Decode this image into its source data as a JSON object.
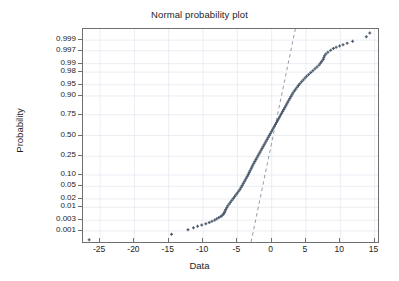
{
  "chart_data": {
    "type": "scatter",
    "title": "Normal probability plot",
    "xlabel": "Data",
    "ylabel": "Probability",
    "grid": true,
    "legend": "none",
    "xlim": [
      -27.5,
      15.5
    ],
    "xticks": [
      -25,
      -20,
      -15,
      -10,
      -5,
      0,
      5,
      10,
      15
    ],
    "xtick_labels": [
      "-25",
      "-20",
      "-15",
      "-10",
      "-5",
      "0",
      "5",
      "10",
      "15"
    ],
    "prob_ticks": [
      0.001,
      0.003,
      0.01,
      0.02,
      0.05,
      0.1,
      0.25,
      0.5,
      0.75,
      0.9,
      0.95,
      0.98,
      0.99,
      0.997,
      0.999
    ],
    "prob_tick_labels": [
      "0.001",
      "0.003",
      "0.01",
      "0.02",
      "0.05",
      "0.10",
      "0.25",
      "0.50",
      "0.75",
      "0.90",
      "0.95",
      "0.98",
      "0.99",
      "0.997",
      "0.999"
    ],
    "zlim": [
      -3.45,
      3.45
    ],
    "series": [
      {
        "name": "sample data",
        "marker": "+",
        "color": "#4a5a6a",
        "points": [
          [
            -26.6,
            -3.38
          ],
          [
            -14.6,
            -3.2
          ],
          [
            -12.2,
            -3.05
          ],
          [
            -11.4,
            -2.99
          ],
          [
            -10.8,
            -2.94
          ],
          [
            -10.2,
            -2.9
          ],
          [
            -9.6,
            -2.86
          ],
          [
            -9.1,
            -2.82
          ],
          [
            -8.7,
            -2.78
          ],
          [
            -8.3,
            -2.74
          ],
          [
            -8.0,
            -2.7
          ],
          [
            -7.7,
            -2.66
          ],
          [
            -7.4,
            -2.62
          ],
          [
            -7.2,
            -2.58
          ],
          [
            -7.0,
            -2.54
          ],
          [
            -6.9,
            -2.5
          ],
          [
            -6.8,
            -2.45
          ],
          [
            -6.7,
            -2.4
          ],
          [
            -6.55,
            -2.34
          ],
          [
            -6.4,
            -2.28
          ],
          [
            -6.2,
            -2.22
          ],
          [
            -6.0,
            -2.16
          ],
          [
            -5.8,
            -2.1
          ],
          [
            -5.6,
            -2.04
          ],
          [
            -5.4,
            -1.98
          ],
          [
            -5.2,
            -1.92
          ],
          [
            -5.0,
            -1.86
          ],
          [
            -4.8,
            -1.8
          ],
          [
            -4.6,
            -1.74
          ],
          [
            -4.45,
            -1.68
          ],
          [
            -4.3,
            -1.62
          ],
          [
            -4.15,
            -1.56
          ],
          [
            -4.0,
            -1.5
          ],
          [
            -3.85,
            -1.44
          ],
          [
            -3.7,
            -1.38
          ],
          [
            -3.55,
            -1.32
          ],
          [
            -3.4,
            -1.26
          ],
          [
            -3.28,
            -1.2
          ],
          [
            -3.15,
            -1.14
          ],
          [
            -3.0,
            -1.08
          ],
          [
            -2.88,
            -1.02
          ],
          [
            -2.75,
            -0.96
          ],
          [
            -2.6,
            -0.9
          ],
          [
            -2.45,
            -0.84
          ],
          [
            -2.3,
            -0.78
          ],
          [
            -2.15,
            -0.72
          ],
          [
            -2.0,
            -0.66
          ],
          [
            -1.85,
            -0.6
          ],
          [
            -1.7,
            -0.54
          ],
          [
            -1.55,
            -0.48
          ],
          [
            -1.4,
            -0.42
          ],
          [
            -1.25,
            -0.36
          ],
          [
            -1.1,
            -0.3
          ],
          [
            -0.95,
            -0.24
          ],
          [
            -0.8,
            -0.18
          ],
          [
            -0.65,
            -0.12
          ],
          [
            -0.5,
            -0.06
          ],
          [
            -0.35,
            0.0
          ],
          [
            -0.2,
            0.06
          ],
          [
            -0.05,
            0.12
          ],
          [
            0.1,
            0.18
          ],
          [
            0.25,
            0.24
          ],
          [
            0.4,
            0.3
          ],
          [
            0.55,
            0.36
          ],
          [
            0.7,
            0.42
          ],
          [
            0.85,
            0.48
          ],
          [
            1.0,
            0.54
          ],
          [
            1.15,
            0.6
          ],
          [
            1.3,
            0.66
          ],
          [
            1.45,
            0.72
          ],
          [
            1.6,
            0.78
          ],
          [
            1.75,
            0.84
          ],
          [
            1.9,
            0.9
          ],
          [
            2.05,
            0.96
          ],
          [
            2.2,
            1.02
          ],
          [
            2.35,
            1.08
          ],
          [
            2.5,
            1.14
          ],
          [
            2.65,
            1.2
          ],
          [
            2.8,
            1.26
          ],
          [
            2.95,
            1.32
          ],
          [
            3.1,
            1.38
          ],
          [
            3.3,
            1.44
          ],
          [
            3.5,
            1.5
          ],
          [
            3.7,
            1.56
          ],
          [
            3.9,
            1.62
          ],
          [
            4.1,
            1.68
          ],
          [
            4.35,
            1.74
          ],
          [
            4.6,
            1.8
          ],
          [
            4.85,
            1.86
          ],
          [
            5.1,
            1.92
          ],
          [
            5.4,
            1.98
          ],
          [
            5.7,
            2.04
          ],
          [
            6.0,
            2.1
          ],
          [
            6.3,
            2.16
          ],
          [
            6.6,
            2.22
          ],
          [
            6.9,
            2.28
          ],
          [
            7.1,
            2.34
          ],
          [
            7.3,
            2.4
          ],
          [
            7.5,
            2.46
          ],
          [
            7.6,
            2.52
          ],
          [
            7.7,
            2.58
          ],
          [
            7.9,
            2.64
          ],
          [
            8.2,
            2.7
          ],
          [
            8.6,
            2.76
          ],
          [
            9.0,
            2.82
          ],
          [
            9.4,
            2.86
          ],
          [
            9.9,
            2.9
          ],
          [
            10.4,
            2.94
          ],
          [
            11.0,
            2.99
          ],
          [
            11.8,
            3.05
          ],
          [
            13.8,
            3.2
          ],
          [
            14.3,
            3.32
          ]
        ]
      }
    ],
    "reference_line": {
      "name": "normal reference line",
      "style": "dashed",
      "color": "#8a8fa0",
      "x_start": -3.0,
      "z_start": -3.45,
      "x_end": 3.45,
      "z_end": 3.45
    }
  }
}
